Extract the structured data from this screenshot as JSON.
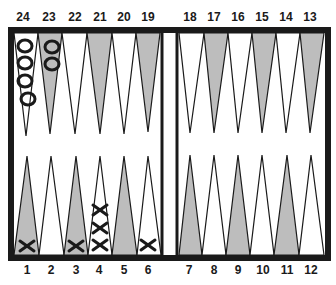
{
  "diagram": {
    "type": "backgammon-board",
    "colors": {
      "frame": "#1a1a1a",
      "dark_point": "#bdbdbd",
      "light_point": "#ffffff",
      "background": "#ffffff"
    },
    "top_labels": [
      "24",
      "23",
      "22",
      "21",
      "20",
      "19",
      "18",
      "17",
      "16",
      "15",
      "14",
      "13"
    ],
    "bottom_labels": [
      "1",
      "2",
      "3",
      "4",
      "5",
      "6",
      "7",
      "8",
      "9",
      "10",
      "11",
      "12"
    ],
    "checkers": {
      "O": {
        "symbol": "circle",
        "points": {
          "24": 4,
          "23": 2
        }
      },
      "X": {
        "symbol": "cross",
        "points": {
          "1": 1,
          "3": 1,
          "4": 3,
          "6": 1
        }
      }
    }
  }
}
